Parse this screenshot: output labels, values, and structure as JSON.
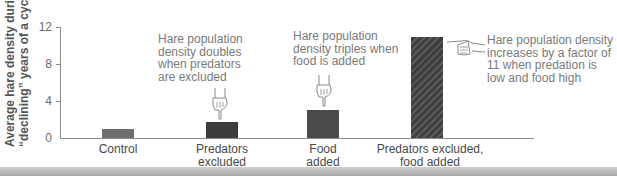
{
  "chart_data": {
    "type": "bar",
    "title": "",
    "xlabel": "",
    "ylabel": "Average hare density during \"declining\" years of a cycle",
    "ylabel_lines": [
      "Average hare density during",
      "“declining” years of a cycle"
    ],
    "ylim": [
      0,
      12
    ],
    "yticks": [
      0,
      4,
      8,
      12
    ],
    "grid": false,
    "legend": null,
    "categories": [
      "Control",
      "Predators excluded",
      "Food added",
      "Predators excluded, food added"
    ],
    "category_label_lines": [
      [
        "Control"
      ],
      [
        "Predators",
        "excluded"
      ],
      [
        "Food",
        "added"
      ],
      [
        "Predators excluded,",
        "food added"
      ]
    ],
    "values": [
      1.0,
      1.7,
      3.0,
      10.9
    ],
    "bar_colors": [
      "#6f6f6f",
      "#3c3c3c",
      "#4a4a4a",
      "#444444"
    ],
    "bar_patterns": [
      "solid",
      "solid",
      "solid",
      "hatched"
    ],
    "annotations": [
      {
        "target": "Predators excluded",
        "lines": [
          "Hare population",
          "density doubles",
          "when predators",
          "are excluded"
        ],
        "pointer": "hand-pointing-down"
      },
      {
        "target": "Food added",
        "lines": [
          "Hare population",
          "density triples when",
          "food is added"
        ],
        "pointer": "hand-pointing-down"
      },
      {
        "target": "Predators excluded, food added",
        "lines": [
          "Hare population density",
          "increases by a factor of",
          "11 when predation is",
          "low and food high"
        ],
        "pointer": "hand-pointing-left"
      }
    ]
  }
}
